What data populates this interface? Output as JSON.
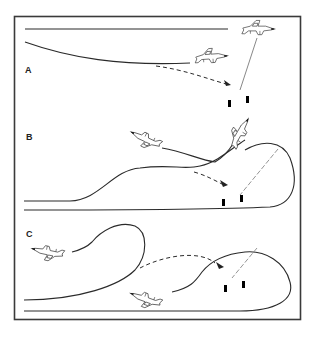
{
  "figure": {
    "type": "attack profile diagram",
    "panels": [
      {
        "label": "A",
        "description": "Level approach; one aircraft flies level overhead, second releases weapon in shallow dive toward bridge",
        "elements": [
          "level-flight-path",
          "shallow-dive-path",
          "dashed-weapon-trajectory",
          "bridge-target",
          "two-aircraft"
        ]
      },
      {
        "label": "B",
        "description": "Low-level approach with pop-up climb and loop; weapon released on dashed trajectory toward bridge",
        "elements": [
          "low-level-ingress",
          "pop-up-climb",
          "loop-path",
          "dashed-weapon-trajectory",
          "bridge-target",
          "two-aircraft"
        ]
      },
      {
        "label": "C",
        "description": "Low-level approach with loops; aircraft pull up and release weapon toward bridge",
        "elements": [
          "low-level-ingress",
          "left-loop",
          "right-loop",
          "dashed-weapon-trajectory",
          "bridge-target",
          "two-aircraft"
        ]
      }
    ],
    "colors": {
      "background": "#ffffff",
      "line": "#2a2a2a",
      "frame": "#3a3a3a",
      "sightline": "#7a7a7a"
    }
  }
}
